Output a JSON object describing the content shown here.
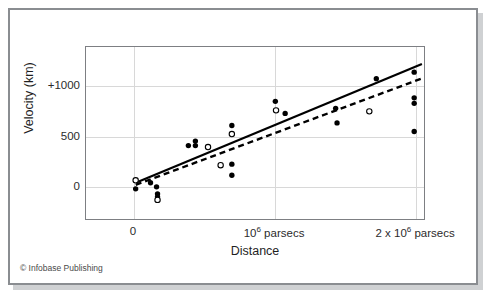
{
  "credit": "© Infobase Publishing",
  "chart_data": {
    "type": "scatter",
    "title": "",
    "xlabel": "Distance",
    "ylabel": "Velocity (km)",
    "xlim": [
      -340000,
      2070000
    ],
    "ylim": [
      -330,
      1380
    ],
    "grid": true,
    "legend": "none",
    "xticks": [
      {
        "value": 0,
        "label": "0",
        "sup": ""
      },
      {
        "value": 1000000,
        "label": "10",
        "sup": "6",
        "suffix": " parsecs"
      },
      {
        "value": 2000000,
        "label": "2 x 10",
        "sup": "6",
        "suffix": " parsecs"
      }
    ],
    "yticks": [
      {
        "value": 1000,
        "label": "+1000"
      },
      {
        "value": 500,
        "label": "500"
      },
      {
        "value": 0,
        "label": "0"
      }
    ],
    "series": [
      {
        "name": "filled-points",
        "marker": "filled-circle",
        "color": "#000000",
        "points": [
          {
            "x": 14000,
            "y": -30
          },
          {
            "x": 120000,
            "y": 30
          },
          {
            "x": 163000,
            "y": -10
          },
          {
            "x": 170000,
            "y": -80
          },
          {
            "x": 170000,
            "y": -110
          },
          {
            "x": 390000,
            "y": 400
          },
          {
            "x": 440000,
            "y": 445
          },
          {
            "x": 440000,
            "y": 400
          },
          {
            "x": 700000,
            "y": 600
          },
          {
            "x": 700000,
            "y": 215
          },
          {
            "x": 700000,
            "y": 105
          },
          {
            "x": 1010000,
            "y": 840
          },
          {
            "x": 1080000,
            "y": 720
          },
          {
            "x": 1440000,
            "y": 770
          },
          {
            "x": 1450000,
            "y": 625
          },
          {
            "x": 1730000,
            "y": 1065
          },
          {
            "x": 2000000,
            "y": 1130
          },
          {
            "x": 2000000,
            "y": 875
          },
          {
            "x": 2000000,
            "y": 820
          },
          {
            "x": 2000000,
            "y": 540
          }
        ]
      },
      {
        "name": "open-points",
        "marker": "open-circle",
        "color": "#000000",
        "points": [
          {
            "x": 14000,
            "y": 55
          },
          {
            "x": 170000,
            "y": -140
          },
          {
            "x": 530000,
            "y": 385
          },
          {
            "x": 620000,
            "y": 205
          },
          {
            "x": 700000,
            "y": 515
          },
          {
            "x": 1015000,
            "y": 750
          },
          {
            "x": 1680000,
            "y": 740
          }
        ]
      }
    ],
    "fits": [
      {
        "name": "solid-fit-line",
        "style": "solid",
        "color": "#000000",
        "x1": 15000,
        "y1": 30,
        "x2": 2055000,
        "y2": 1210
      },
      {
        "name": "dashed-fit-line",
        "style": "dashed",
        "color": "#000000",
        "x1": 15000,
        "y1": 10,
        "x2": 2060000,
        "y2": 1070
      }
    ]
  }
}
